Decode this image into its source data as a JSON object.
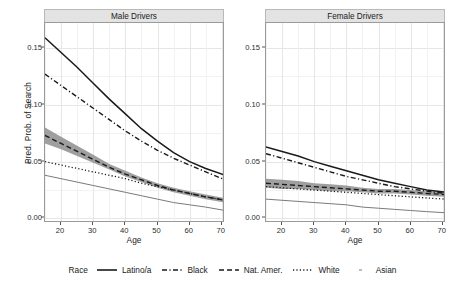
{
  "chart_data": {
    "type": "line",
    "title": "",
    "xlabel": "Age",
    "ylabel": "Pred. Prob. of Search",
    "xlim": [
      15,
      71
    ],
    "ylim": [
      -0.004,
      0.172
    ],
    "xticks": [
      20,
      30,
      40,
      50,
      60,
      70
    ],
    "xticklabels": [
      "20",
      "30",
      "40",
      "50",
      "60",
      "70"
    ],
    "yticks": [
      0.0,
      0.05,
      0.1,
      0.15
    ],
    "yticklabels": [
      "0.00",
      "0.05",
      "0.10",
      "0.15"
    ],
    "grid": "minor-and-major light gray, vertical and horizontal",
    "legend_position": "bottom",
    "legend_title": "Race",
    "facets": [
      {
        "label": "Male Drivers",
        "x": [
          15,
          20,
          25,
          30,
          35,
          40,
          45,
          50,
          55,
          60,
          65,
          71
        ],
        "series": [
          {
            "name": "Latino/a",
            "linestyle": "solid",
            "color": "#1a1a1a",
            "width": 1.5,
            "values": [
              0.159,
              0.146,
              0.133,
              0.119,
              0.105,
              0.092,
              0.079,
              0.068,
              0.058,
              0.05,
              0.044,
              0.038
            ]
          },
          {
            "name": "Black",
            "linestyle": "dashdot",
            "color": "#1a1a1a",
            "width": 1.4,
            "values": [
              0.127,
              0.117,
              0.107,
              0.097,
              0.087,
              0.077,
              0.068,
              0.06,
              0.053,
              0.047,
              0.041,
              0.034
            ]
          },
          {
            "name": "Nat. Amer.",
            "linestyle": "dashed",
            "color": "#1a1a1a",
            "width": 1.4,
            "values": [
              0.073,
              0.066,
              0.059,
              0.052,
              0.045,
              0.039,
              0.034,
              0.029,
              0.025,
              0.022,
              0.019,
              0.016
            ],
            "ci_low": [
              0.066,
              0.061,
              0.055,
              0.049,
              0.043,
              0.037,
              0.032,
              0.027,
              0.023,
              0.02,
              0.017,
              0.014
            ],
            "ci_high": [
              0.08,
              0.072,
              0.064,
              0.056,
              0.048,
              0.042,
              0.036,
              0.031,
              0.027,
              0.024,
              0.021,
              0.018
            ],
            "ci_color": "#8e8e8e"
          },
          {
            "name": "White",
            "linestyle": "dotted",
            "color": "#1a1a1a",
            "width": 1.3,
            "values": [
              0.05,
              0.047,
              0.044,
              0.041,
              0.038,
              0.035,
              0.031,
              0.028,
              0.025,
              0.022,
              0.019,
              0.016
            ]
          },
          {
            "name": "Asian",
            "linestyle": "thinsolid",
            "color": "#6b6b6b",
            "width": 0.9,
            "values": [
              0.038,
              0.035,
              0.032,
              0.029,
              0.026,
              0.023,
              0.02,
              0.017,
              0.014,
              0.012,
              0.01,
              0.007
            ]
          }
        ]
      },
      {
        "label": "Female Drivers",
        "x": [
          15,
          20,
          25,
          30,
          35,
          40,
          45,
          50,
          55,
          60,
          65,
          71
        ],
        "series": [
          {
            "name": "Latino/a",
            "linestyle": "solid",
            "color": "#1a1a1a",
            "width": 1.5,
            "values": [
              0.063,
              0.059,
              0.055,
              0.05,
              0.046,
              0.042,
              0.038,
              0.034,
              0.031,
              0.028,
              0.025,
              0.023
            ]
          },
          {
            "name": "Black",
            "linestyle": "dashdot",
            "color": "#1a1a1a",
            "width": 1.4,
            "values": [
              0.057,
              0.053,
              0.049,
              0.045,
              0.041,
              0.037,
              0.034,
              0.031,
              0.028,
              0.026,
              0.024,
              0.022
            ]
          },
          {
            "name": "Nat. Amer.",
            "linestyle": "dashed",
            "color": "#1a1a1a",
            "width": 1.4,
            "values": [
              0.031,
              0.03,
              0.029,
              0.028,
              0.027,
              0.026,
              0.025,
              0.024,
              0.024,
              0.023,
              0.022,
              0.021
            ],
            "ci_low": [
              0.027,
              0.026,
              0.026,
              0.025,
              0.024,
              0.024,
              0.023,
              0.022,
              0.022,
              0.021,
              0.02,
              0.019
            ],
            "ci_high": [
              0.035,
              0.034,
              0.033,
              0.031,
              0.03,
              0.029,
              0.027,
              0.026,
              0.026,
              0.025,
              0.024,
              0.023
            ],
            "ci_color": "#8e8e8e"
          },
          {
            "name": "White",
            "linestyle": "dotted",
            "color": "#1a1a1a",
            "width": 1.3,
            "values": [
              0.028,
              0.027,
              0.026,
              0.025,
              0.024,
              0.023,
              0.022,
              0.021,
              0.02,
              0.019,
              0.018,
              0.017
            ]
          },
          {
            "name": "Asian",
            "linestyle": "thinsolid",
            "color": "#6b6b6b",
            "width": 0.9,
            "values": [
              0.017,
              0.016,
              0.015,
              0.014,
              0.013,
              0.012,
              0.01,
              0.009,
              0.008,
              0.007,
              0.006,
              0.005
            ]
          }
        ]
      }
    ],
    "legend_entries": [
      {
        "label": "Latino/a",
        "style": "solid"
      },
      {
        "label": "Black",
        "style": "dashdot"
      },
      {
        "label": "Nat. Amer.",
        "style": "dashed"
      },
      {
        "label": "White",
        "style": "dotted"
      },
      {
        "label": "Asian",
        "style": "thinsolid"
      }
    ]
  }
}
